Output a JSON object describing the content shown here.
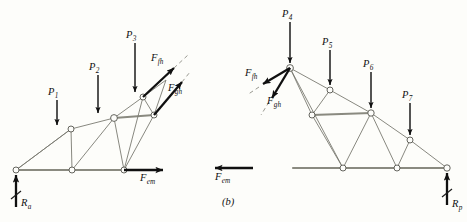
{
  "figure": {
    "caption": "(b)",
    "background_color": "#fdfdfa",
    "member_color": "#7a7a72",
    "chord_color": "#8a8a80",
    "force_color": "#101010"
  },
  "left_truss": {
    "name": "left-free-body-diagram",
    "loads": [
      {
        "id": "p1",
        "label": "P",
        "sub": "1"
      },
      {
        "id": "p2",
        "label": "P",
        "sub": "2"
      },
      {
        "id": "p3",
        "label": "P",
        "sub": "3"
      }
    ],
    "forces": [
      {
        "id": "f-fh",
        "label": "F",
        "sub": "fh"
      },
      {
        "id": "f-gh",
        "label": "F",
        "sub": "gh"
      },
      {
        "id": "f-em",
        "label": "F",
        "sub": "em"
      }
    ],
    "reaction": {
      "id": "ra",
      "label": "R",
      "sub": "a"
    }
  },
  "right_truss": {
    "name": "right-free-body-diagram",
    "loads": [
      {
        "id": "p4",
        "label": "P",
        "sub": "4"
      },
      {
        "id": "p5",
        "label": "P",
        "sub": "5"
      },
      {
        "id": "p6",
        "label": "P",
        "sub": "6"
      },
      {
        "id": "p7",
        "label": "P",
        "sub": "7"
      }
    ],
    "forces": [
      {
        "id": "f-fh-r",
        "label": "F",
        "sub": "fh"
      },
      {
        "id": "f-gh-r",
        "label": "F",
        "sub": "gh"
      },
      {
        "id": "f-em-r",
        "label": "F",
        "sub": "em"
      }
    ],
    "reaction": {
      "id": "rp",
      "label": "R",
      "sub": "p"
    }
  }
}
